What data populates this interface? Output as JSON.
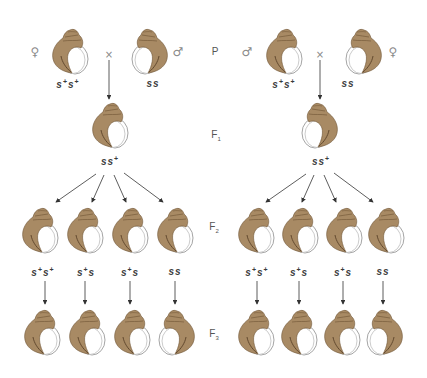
{
  "diagram": {
    "colors": {
      "shell_fill": "#a88a64",
      "shell_dark": "#6e5434",
      "aperture_stroke": "#9a9a9a",
      "arrow": "#333333",
      "text": "#3a3a3a"
    },
    "generation_labels": [
      {
        "id": "P",
        "text": "P",
        "sub": ""
      },
      {
        "id": "F1",
        "text": "F",
        "sub": "1"
      },
      {
        "id": "F2",
        "text": "F",
        "sub": "2"
      },
      {
        "id": "F3",
        "text": "F",
        "sub": "3"
      }
    ],
    "cross_symbol": "×",
    "left_cross": {
      "parents": [
        {
          "sex_symbol": "♀",
          "sex": "female",
          "genotype": {
            "a": "s",
            "a_sup": "+",
            "b": "s",
            "b_sup": "+"
          },
          "coiling": "dextral"
        },
        {
          "sex_symbol": "♂",
          "sex": "male",
          "genotype": {
            "a": "s",
            "a_sup": "",
            "b": "s",
            "b_sup": ""
          },
          "coiling": "sinistral"
        }
      ],
      "f1": {
        "genotype": {
          "a": "s",
          "a_sup": "",
          "b": "s",
          "b_sup": "+"
        },
        "coiling": "dextral"
      },
      "f2": [
        {
          "genotype": {
            "a": "s",
            "a_sup": "+",
            "b": "s",
            "b_sup": "+"
          },
          "coiling": "dextral"
        },
        {
          "genotype": {
            "a": "s",
            "a_sup": "+",
            "b": "s",
            "b_sup": ""
          },
          "coiling": "dextral"
        },
        {
          "genotype": {
            "a": "s",
            "a_sup": "+",
            "b": "s",
            "b_sup": ""
          },
          "coiling": "dextral"
        },
        {
          "genotype": {
            "a": "s",
            "a_sup": "",
            "b": "s",
            "b_sup": ""
          },
          "coiling": "dextral"
        }
      ],
      "f3": [
        {
          "coiling": "dextral"
        },
        {
          "coiling": "dextral"
        },
        {
          "coiling": "dextral"
        },
        {
          "coiling": "sinistral"
        }
      ]
    },
    "right_cross": {
      "parents": [
        {
          "sex_symbol": "♂",
          "sex": "male",
          "genotype": {
            "a": "s",
            "a_sup": "+",
            "b": "s",
            "b_sup": "+"
          },
          "coiling": "dextral"
        },
        {
          "sex_symbol": "♀",
          "sex": "female",
          "genotype": {
            "a": "s",
            "a_sup": "",
            "b": "s",
            "b_sup": ""
          },
          "coiling": "sinistral"
        }
      ],
      "f1": {
        "genotype": {
          "a": "s",
          "a_sup": "",
          "b": "s",
          "b_sup": "+"
        },
        "coiling": "sinistral"
      },
      "f2": [
        {
          "genotype": {
            "a": "s",
            "a_sup": "+",
            "b": "s",
            "b_sup": "+"
          },
          "coiling": "dextral"
        },
        {
          "genotype": {
            "a": "s",
            "a_sup": "+",
            "b": "s",
            "b_sup": ""
          },
          "coiling": "dextral"
        },
        {
          "genotype": {
            "a": "s",
            "a_sup": "+",
            "b": "s",
            "b_sup": ""
          },
          "coiling": "dextral"
        },
        {
          "genotype": {
            "a": "s",
            "a_sup": "",
            "b": "s",
            "b_sup": ""
          },
          "coiling": "dextral"
        }
      ],
      "f3": [
        {
          "coiling": "dextral"
        },
        {
          "coiling": "dextral"
        },
        {
          "coiling": "dextral"
        },
        {
          "coiling": "sinistral"
        }
      ]
    }
  }
}
